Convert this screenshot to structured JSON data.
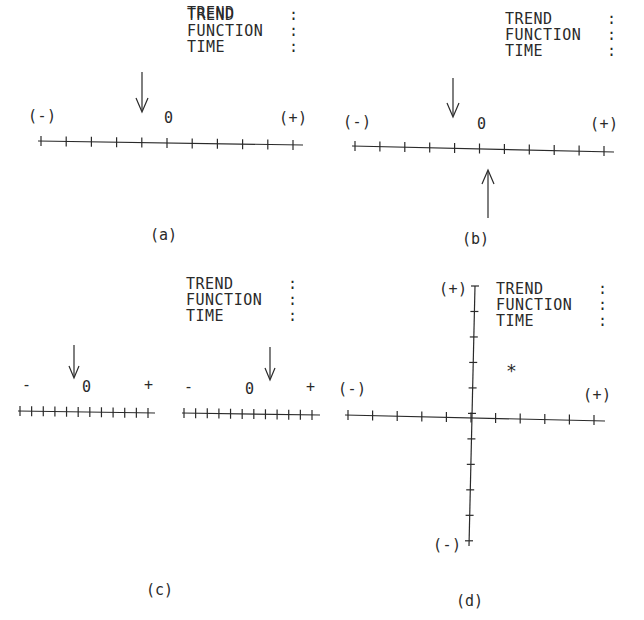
{
  "field_labels": {
    "trend": "TREND",
    "function": "FUNCTION",
    "time": "TIME",
    "sep": ":"
  },
  "panels": {
    "a": {
      "caption": "(a)",
      "neg": "(-)",
      "pos": "(+)",
      "zero": "0",
      "ticks": 11,
      "arrow_down_tick": 4
    },
    "b": {
      "caption": "(b)",
      "neg": "(-)",
      "pos": "(+)",
      "zero": "0",
      "ticks": 11,
      "arrow_down_tick": 4,
      "arrow_up_tick": 5
    },
    "c": {
      "caption": "(c)",
      "left": {
        "neg": "-",
        "pos": "+",
        "zero": "0",
        "ticks": 12,
        "arrow_down_tick": 4
      },
      "right": {
        "neg": "-",
        "pos": "+",
        "zero": "0",
        "ticks": 12,
        "arrow_down_tick": 7
      }
    },
    "d": {
      "caption": "(d)",
      "x_neg": "(-)",
      "x_pos": "(+)",
      "y_pos": "(+)",
      "y_neg": "(-)",
      "marker": "*",
      "marker_pos": {
        "x": 1.5,
        "y": 2
      }
    }
  },
  "chart_data": {
    "type": "scatter",
    "panels": [
      {
        "id": "a",
        "scale": "1D",
        "range": [
          -5,
          5
        ],
        "indicators": [
          {
            "dir": "down",
            "value": -1
          }
        ]
      },
      {
        "id": "b",
        "scale": "1D",
        "range": [
          -5,
          5
        ],
        "indicators": [
          {
            "dir": "down",
            "value": -1
          },
          {
            "dir": "up",
            "value": 0
          }
        ]
      },
      {
        "id": "c",
        "scale": "dual 1D",
        "range": [
          -5,
          5
        ],
        "indicators": [
          {
            "scale": "left",
            "dir": "down",
            "value": -1
          },
          {
            "scale": "right",
            "dir": "down",
            "value": 1
          }
        ]
      },
      {
        "id": "d",
        "scale": "2D",
        "xrange": [
          -5,
          5
        ],
        "yrange": [
          -5,
          5
        ],
        "points": [
          {
            "x": 1.5,
            "y": 2,
            "marker": "*"
          }
        ]
      }
    ]
  }
}
